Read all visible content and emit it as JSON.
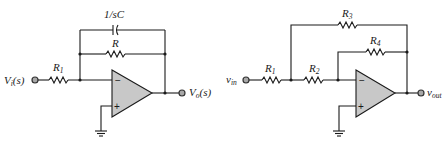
{
  "left_circuit": {
    "input_label": {
      "main": "V",
      "sub": "i",
      "tail": "(s)"
    },
    "output_label": {
      "main": "V",
      "sub": "o",
      "tail": "(s)"
    },
    "r1_label": {
      "main": "R",
      "sub": "1"
    },
    "r_label": {
      "main": "R"
    },
    "cap_label": "1/sC",
    "opamp": {
      "minus": "−",
      "plus": "+"
    }
  },
  "right_circuit": {
    "input_label": {
      "main": "v",
      "sub": "in"
    },
    "output_label": {
      "main": "v",
      "sub": "out"
    },
    "r1_label": {
      "main": "R",
      "sub": "1"
    },
    "r2_label": {
      "main": "R",
      "sub": "2"
    },
    "r3_label": {
      "main": "R",
      "sub": "3"
    },
    "r4_label": {
      "main": "R",
      "sub": "4"
    },
    "opamp": {
      "minus": "−",
      "plus": "+"
    }
  }
}
